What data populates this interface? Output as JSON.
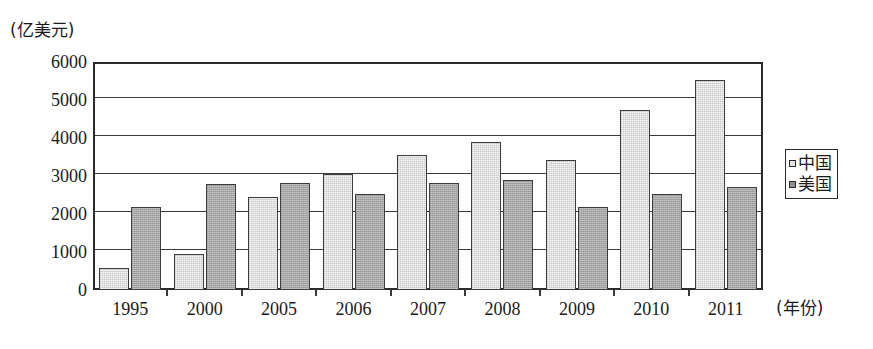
{
  "chart_data": {
    "type": "bar",
    "title": "",
    "xlabel": "(年份)",
    "ylabel": "(亿美元)",
    "categories": [
      "1995",
      "2000",
      "2005",
      "2006",
      "2007",
      "2008",
      "2009",
      "2010",
      "2011"
    ],
    "series": [
      {
        "name": "中国",
        "values": [
          570,
          950,
          2450,
          3050,
          3550,
          3900,
          3420,
          4730,
          5520
        ],
        "color": "#dedede"
      },
      {
        "name": "美国",
        "values": [
          2180,
          2800,
          2820,
          2520,
          2820,
          2900,
          2180,
          2520,
          2700
        ],
        "color": "#a6a6a6"
      }
    ],
    "ylim": [
      0,
      6000
    ],
    "yticks": [
      0,
      1000,
      2000,
      3000,
      4000,
      5000,
      6000
    ],
    "ytick_labels": [
      "0",
      "1000",
      "2000",
      "3000",
      "4000",
      "5000",
      "6000"
    ],
    "grid": true,
    "grid_axis": "y",
    "legend_position": "right",
    "legend_entries": [
      "中国",
      "美国"
    ]
  },
  "axes": {
    "y_unit_caption": "(亿美元)",
    "x_unit_caption": "(年份)"
  },
  "legend": {
    "items": [
      {
        "label": "中国",
        "swatch": "legend-swatch-light"
      },
      {
        "label": "美国",
        "swatch": "legend-swatch-dark"
      }
    ]
  }
}
